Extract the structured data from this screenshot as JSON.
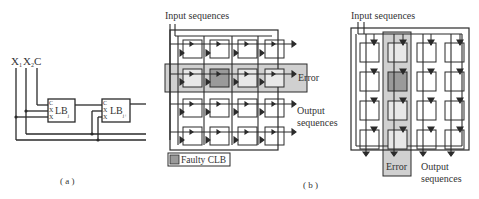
{
  "panel_a": {
    "inputs": [
      "X",
      "X",
      "C"
    ],
    "input_subs": [
      "1",
      "2",
      ""
    ],
    "block1": {
      "name": "LB",
      "sub": "j",
      "pins": [
        "C",
        "X",
        "X"
      ],
      "pin_subs": [
        "",
        "1",
        "2"
      ]
    },
    "block2": {
      "name": "LB",
      "sub": "j+",
      "pins": [
        "C",
        "X",
        "X"
      ],
      "pin_subs": [
        "",
        "1",
        "2"
      ]
    },
    "caption": "( a )"
  },
  "panel_b_left": {
    "input_label": "Input sequences",
    "error_label": "Error",
    "output_label_1": "Output",
    "output_label_2": "sequences",
    "legend_label": "Faulty CLB",
    "grid": {
      "rows": 4,
      "cols": 4,
      "faulty_row": 1,
      "faulty_col": 1,
      "error_row": 1
    }
  },
  "panel_b_right": {
    "input_label": "Input sequences",
    "error_label": "Error",
    "output_label_1": "Output",
    "output_label_2": "sequences",
    "grid": {
      "rows": 4,
      "cols": 4,
      "faulty_row": 1,
      "faulty_col": 1,
      "error_col": 1
    }
  },
  "caption_b": "( b )",
  "colors": {
    "line": "#2a2a2a",
    "error_band": "#d0d0d0",
    "faulty_cell": "#9a9a9a",
    "background": "#ffffff"
  }
}
